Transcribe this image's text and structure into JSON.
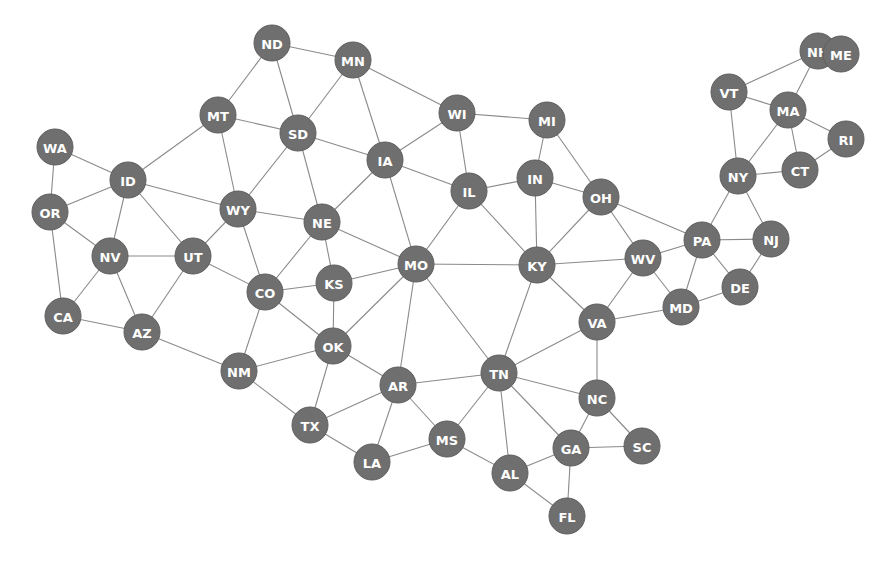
{
  "diagram": {
    "type": "graph",
    "node_color": "#6f6f6f",
    "edge_color": "#8a8a8a",
    "label_color": "#ffffff",
    "node_radius": 18,
    "nodes": [
      {
        "id": "WA",
        "x": 55,
        "y": 147
      },
      {
        "id": "OR",
        "x": 50,
        "y": 212
      },
      {
        "id": "CA",
        "x": 63,
        "y": 316
      },
      {
        "id": "NV",
        "x": 110,
        "y": 256
      },
      {
        "id": "ID",
        "x": 128,
        "y": 180
      },
      {
        "id": "MT",
        "x": 218,
        "y": 115
      },
      {
        "id": "ND",
        "x": 272,
        "y": 43
      },
      {
        "id": "SD",
        "x": 298,
        "y": 133
      },
      {
        "id": "MN",
        "x": 353,
        "y": 60
      },
      {
        "id": "WY",
        "x": 238,
        "y": 209
      },
      {
        "id": "UT",
        "x": 193,
        "y": 256
      },
      {
        "id": "AZ",
        "x": 142,
        "y": 332
      },
      {
        "id": "CO",
        "x": 265,
        "y": 292
      },
      {
        "id": "NE",
        "x": 322,
        "y": 222
      },
      {
        "id": "KS",
        "x": 334,
        "y": 283
      },
      {
        "id": "NM",
        "x": 239,
        "y": 371
      },
      {
        "id": "OK",
        "x": 333,
        "y": 346
      },
      {
        "id": "TX",
        "x": 310,
        "y": 425
      },
      {
        "id": "AR",
        "x": 398,
        "y": 385
      },
      {
        "id": "LA",
        "x": 372,
        "y": 462
      },
      {
        "id": "MS",
        "x": 447,
        "y": 439
      },
      {
        "id": "MO",
        "x": 416,
        "y": 264
      },
      {
        "id": "IA",
        "x": 385,
        "y": 160
      },
      {
        "id": "WI",
        "x": 457,
        "y": 113
      },
      {
        "id": "IL",
        "x": 469,
        "y": 191
      },
      {
        "id": "MI",
        "x": 547,
        "y": 120
      },
      {
        "id": "IN",
        "x": 535,
        "y": 178
      },
      {
        "id": "OH",
        "x": 601,
        "y": 197
      },
      {
        "id": "KY",
        "x": 537,
        "y": 265
      },
      {
        "id": "WV",
        "x": 643,
        "y": 258
      },
      {
        "id": "PA",
        "x": 702,
        "y": 240
      },
      {
        "id": "NJ",
        "x": 771,
        "y": 239
      },
      {
        "id": "DE",
        "x": 740,
        "y": 287
      },
      {
        "id": "MD",
        "x": 681,
        "y": 307
      },
      {
        "id": "VA",
        "x": 597,
        "y": 322
      },
      {
        "id": "TN",
        "x": 499,
        "y": 373
      },
      {
        "id": "NC",
        "x": 597,
        "y": 398
      },
      {
        "id": "SC",
        "x": 642,
        "y": 446
      },
      {
        "id": "GA",
        "x": 571,
        "y": 448
      },
      {
        "id": "AL",
        "x": 510,
        "y": 473
      },
      {
        "id": "FL",
        "x": 567,
        "y": 516
      },
      {
        "id": "NY",
        "x": 738,
        "y": 176
      },
      {
        "id": "VT",
        "x": 729,
        "y": 92
      },
      {
        "id": "NH",
        "x": 818,
        "y": 51
      },
      {
        "id": "ME",
        "x": 841,
        "y": 54
      },
      {
        "id": "MA",
        "x": 788,
        "y": 110
      },
      {
        "id": "RI",
        "x": 846,
        "y": 139
      },
      {
        "id": "CT",
        "x": 800,
        "y": 170
      }
    ],
    "edges": [
      [
        "WA",
        "ID"
      ],
      [
        "WA",
        "OR"
      ],
      [
        "OR",
        "ID"
      ],
      [
        "OR",
        "NV"
      ],
      [
        "OR",
        "CA"
      ],
      [
        "CA",
        "NV"
      ],
      [
        "CA",
        "AZ"
      ],
      [
        "NV",
        "ID"
      ],
      [
        "NV",
        "UT"
      ],
      [
        "NV",
        "AZ"
      ],
      [
        "ID",
        "MT"
      ],
      [
        "ID",
        "WY"
      ],
      [
        "ID",
        "UT"
      ],
      [
        "MT",
        "ND"
      ],
      [
        "MT",
        "SD"
      ],
      [
        "MT",
        "WY"
      ],
      [
        "ND",
        "SD"
      ],
      [
        "ND",
        "MN"
      ],
      [
        "SD",
        "MN"
      ],
      [
        "SD",
        "IA"
      ],
      [
        "SD",
        "NE"
      ],
      [
        "SD",
        "WY"
      ],
      [
        "MN",
        "IA"
      ],
      [
        "MN",
        "WI"
      ],
      [
        "WY",
        "NE"
      ],
      [
        "WY",
        "CO"
      ],
      [
        "WY",
        "UT"
      ],
      [
        "UT",
        "CO"
      ],
      [
        "UT",
        "AZ"
      ],
      [
        "AZ",
        "NM"
      ],
      [
        "CO",
        "NE"
      ],
      [
        "CO",
        "KS"
      ],
      [
        "CO",
        "OK"
      ],
      [
        "CO",
        "NM"
      ],
      [
        "NE",
        "IA"
      ],
      [
        "NE",
        "MO"
      ],
      [
        "NE",
        "KS"
      ],
      [
        "KS",
        "MO"
      ],
      [
        "KS",
        "OK"
      ],
      [
        "NM",
        "OK"
      ],
      [
        "NM",
        "TX"
      ],
      [
        "OK",
        "TX"
      ],
      [
        "OK",
        "AR"
      ],
      [
        "OK",
        "MO"
      ],
      [
        "TX",
        "AR"
      ],
      [
        "TX",
        "LA"
      ],
      [
        "AR",
        "MO"
      ],
      [
        "AR",
        "TN"
      ],
      [
        "AR",
        "MS"
      ],
      [
        "AR",
        "LA"
      ],
      [
        "LA",
        "MS"
      ],
      [
        "MS",
        "TN"
      ],
      [
        "MS",
        "AL"
      ],
      [
        "MO",
        "IA"
      ],
      [
        "MO",
        "IL"
      ],
      [
        "MO",
        "KY"
      ],
      [
        "MO",
        "TN"
      ],
      [
        "IA",
        "WI"
      ],
      [
        "IA",
        "IL"
      ],
      [
        "WI",
        "IL"
      ],
      [
        "WI",
        "MI"
      ],
      [
        "IL",
        "IN"
      ],
      [
        "IL",
        "KY"
      ],
      [
        "MI",
        "IN"
      ],
      [
        "MI",
        "OH"
      ],
      [
        "IN",
        "OH"
      ],
      [
        "IN",
        "KY"
      ],
      [
        "OH",
        "KY"
      ],
      [
        "OH",
        "WV"
      ],
      [
        "OH",
        "PA"
      ],
      [
        "KY",
        "WV"
      ],
      [
        "KY",
        "VA"
      ],
      [
        "KY",
        "TN"
      ],
      [
        "WV",
        "PA"
      ],
      [
        "WV",
        "MD"
      ],
      [
        "WV",
        "VA"
      ],
      [
        "PA",
        "NY"
      ],
      [
        "PA",
        "NJ"
      ],
      [
        "PA",
        "DE"
      ],
      [
        "PA",
        "MD"
      ],
      [
        "NJ",
        "NY"
      ],
      [
        "NJ",
        "DE"
      ],
      [
        "DE",
        "MD"
      ],
      [
        "MD",
        "VA"
      ],
      [
        "VA",
        "TN"
      ],
      [
        "VA",
        "NC"
      ],
      [
        "TN",
        "NC"
      ],
      [
        "TN",
        "GA"
      ],
      [
        "TN",
        "AL"
      ],
      [
        "NC",
        "GA"
      ],
      [
        "NC",
        "SC"
      ],
      [
        "SC",
        "GA"
      ],
      [
        "GA",
        "AL"
      ],
      [
        "GA",
        "FL"
      ],
      [
        "AL",
        "FL"
      ],
      [
        "NY",
        "VT"
      ],
      [
        "NY",
        "MA"
      ],
      [
        "NY",
        "CT"
      ],
      [
        "VT",
        "NH"
      ],
      [
        "VT",
        "MA"
      ],
      [
        "NH",
        "ME"
      ],
      [
        "NH",
        "MA"
      ],
      [
        "MA",
        "RI"
      ],
      [
        "MA",
        "CT"
      ],
      [
        "CT",
        "RI"
      ]
    ]
  }
}
